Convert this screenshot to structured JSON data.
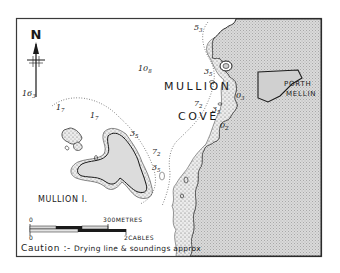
{
  "map": {
    "title": "Mullion Cove",
    "colors": {
      "land": "#d4d4d4",
      "land_dots": "#9a9a9a",
      "drying": "#e4e4e4",
      "ink": "#1a1a1a",
      "frame": "#3a3a3a"
    },
    "north_arrow": {
      "label": "N"
    },
    "place_names": {
      "mullion": "MULLION",
      "cove": "COVE",
      "porth": "PORTH",
      "mellin": "MELLIN",
      "island": "MULLION I."
    },
    "soundings": [
      {
        "id": "s163",
        "main": "16",
        "sub": "3"
      },
      {
        "id": "s108",
        "main": "10",
        "sub": "8"
      },
      {
        "id": "s53",
        "main": "5",
        "sub": "3"
      },
      {
        "id": "s17a",
        "main": "1",
        "sub": "7"
      },
      {
        "id": "s17b",
        "main": "1",
        "sub": "7"
      },
      {
        "id": "s35a",
        "main": "3",
        "sub": "5"
      },
      {
        "id": "s35b",
        "main": "3",
        "sub": "5"
      },
      {
        "id": "s35c",
        "main": "3",
        "sub": "5"
      },
      {
        "id": "s35d",
        "main": "3",
        "sub": "5"
      },
      {
        "id": "s72a",
        "main": "7",
        "sub": "2"
      },
      {
        "id": "s72b",
        "main": "7",
        "sub": "2"
      },
      {
        "id": "s03",
        "main": "0",
        "sub": "3"
      },
      {
        "id": "s02",
        "main": "0",
        "sub": "2"
      }
    ],
    "scale": {
      "metres_zero": "0",
      "metres_label": "300METRES",
      "cables_zero": "0",
      "cables_label": "2CABLES"
    },
    "caution": {
      "heading": "Caution :-",
      "text": "Drying line & soundings approx"
    }
  }
}
